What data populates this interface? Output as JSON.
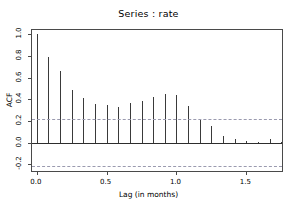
{
  "chart_data": {
    "type": "bar",
    "title": "Series : rate",
    "xlabel": "Lag (in months)",
    "ylabel": "ACF",
    "xlim": [
      -0.035,
      1.77
    ],
    "ylim": [
      -0.28,
      1.04
    ],
    "grid": false,
    "legend": null,
    "x_ticks": [
      "0.0",
      "0.5",
      "1.0",
      "1.5"
    ],
    "x_tick_values": [
      0.0,
      0.5,
      1.0,
      1.5
    ],
    "y_ticks": [
      "1.0",
      "0.8",
      "0.6",
      "0.4",
      "0.2",
      "0.0",
      "-0.2"
    ],
    "y_tick_values": [
      1.0,
      0.8,
      0.6,
      0.4,
      0.2,
      0.0,
      -0.2
    ],
    "x": [
      0.0,
      0.083,
      0.167,
      0.25,
      0.333,
      0.417,
      0.5,
      0.583,
      0.667,
      0.75,
      0.833,
      0.917,
      1.0,
      1.083,
      1.167,
      1.25,
      1.333,
      1.417,
      1.5,
      1.583,
      1.667,
      1.75
    ],
    "values": [
      1.0,
      0.79,
      0.66,
      0.49,
      0.41,
      0.355,
      0.345,
      0.33,
      0.365,
      0.385,
      0.425,
      0.45,
      0.44,
      0.34,
      0.215,
      0.155,
      0.065,
      0.035,
      0.02,
      0.005,
      0.03,
      0.005
    ],
    "annotations": [
      {
        "name": "confidence-band-upper",
        "value": 0.215,
        "style": "dashed"
      },
      {
        "name": "confidence-band-lower",
        "value": -0.215,
        "style": "dashed"
      },
      {
        "name": "zero-line",
        "value": 0.0,
        "style": "solid"
      }
    ]
  },
  "colors": {
    "spike": "#3a3a3a",
    "axis": "#4a4a4a",
    "confidence": "#9a9aaf",
    "zero": "#2d2d2d",
    "background": "#ffffff",
    "text": "#000000"
  }
}
